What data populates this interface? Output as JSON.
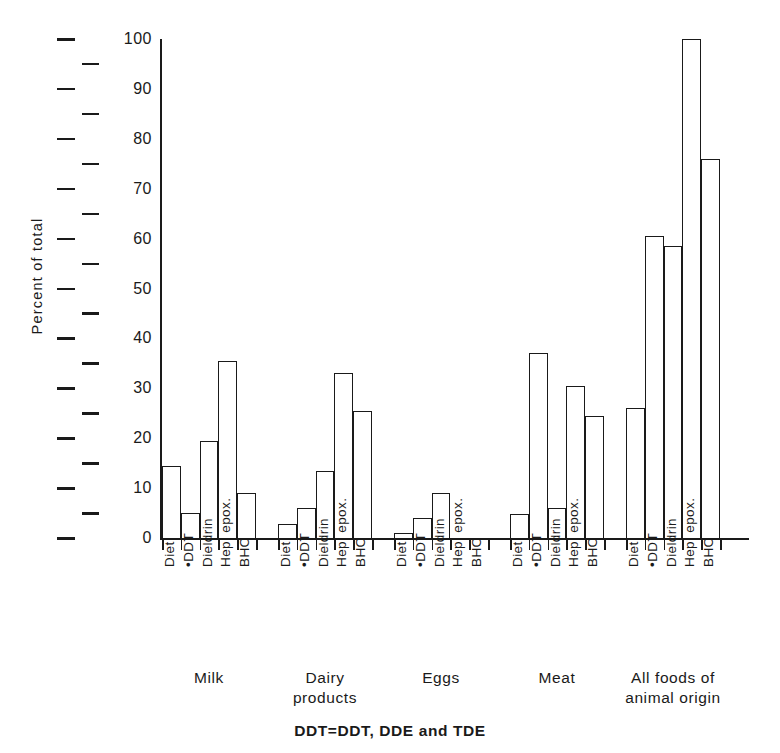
{
  "chart_data": {
    "type": "bar",
    "title": "",
    "xlabel": "",
    "ylabel": "Percent of total",
    "ylim": [
      0,
      100
    ],
    "grid": false,
    "legend": "none",
    "footnote": "DDT=DDT, DDE and TDE",
    "y_major_ticks": [
      0,
      10,
      20,
      30,
      40,
      50,
      60,
      70,
      80,
      90,
      100
    ],
    "y_minor_ticks": [
      5,
      15,
      25,
      35,
      45,
      55,
      65,
      75,
      85,
      95
    ],
    "y_tick_labels": [
      "0",
      "10",
      "20",
      "30",
      "40",
      "50",
      "60",
      "70",
      "80",
      "90",
      "100"
    ],
    "categories": [
      "Diet",
      "•DDT",
      "Dieldrin",
      "Hep. epox.",
      "BHC"
    ],
    "groups": [
      {
        "name": "Milk",
        "label": "Milk",
        "values": [
          14.5,
          5,
          19.5,
          35.5,
          9
        ]
      },
      {
        "name": "Dairy products",
        "label": "Dairy\nproducts",
        "values": [
          2.8,
          6,
          13.5,
          33,
          25.5
        ]
      },
      {
        "name": "Eggs",
        "label": "Eggs",
        "values": [
          1,
          4,
          9,
          0,
          0
        ]
      },
      {
        "name": "Meat",
        "label": "Meat",
        "values": [
          4.8,
          37,
          6,
          30.5,
          24.5
        ]
      },
      {
        "name": "All foods of animal origin",
        "label": "All foods of\nanimal origin",
        "values": [
          26,
          60.5,
          58.5,
          100,
          76
        ]
      }
    ],
    "colors": {
      "ink": "#1a1a1a",
      "bar_fill": "#ffffff",
      "background": "#ffffff"
    }
  }
}
